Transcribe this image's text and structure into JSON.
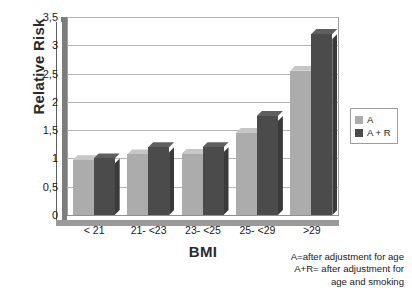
{
  "chart_data": {
    "type": "bar",
    "title": "",
    "xlabel": "BMI",
    "ylabel": "Relative Risk",
    "categories": [
      "< 21",
      "21- <23",
      "23- <25",
      "25- <29",
      ">29"
    ],
    "series": [
      {
        "name": "A",
        "color": "#acacac",
        "values": [
          0.97,
          1.07,
          1.08,
          1.45,
          2.55
        ]
      },
      {
        "name": "A + R",
        "color": "#4b4b4b",
        "values": [
          1.0,
          1.2,
          1.2,
          1.75,
          3.2
        ]
      }
    ],
    "ylim": [
      0,
      3.5
    ],
    "ytick_labels": [
      "0",
      "0,5",
      "1",
      "1,5",
      "2",
      "2,5",
      "3",
      "3,5"
    ],
    "ytick_values": [
      0,
      0.5,
      1,
      1.5,
      2,
      2.5,
      3,
      3.5
    ],
    "grid": true,
    "legend_position": "right",
    "decimal_separator": ","
  },
  "legend": {
    "items": [
      {
        "label": "A",
        "series": "series-a"
      },
      {
        "label": "A + R",
        "series": "series-ar"
      }
    ]
  },
  "footnote": {
    "line1": "A=after adjustment for age",
    "line2": "A+R= after adjustment for",
    "line3": "age and smoking"
  }
}
